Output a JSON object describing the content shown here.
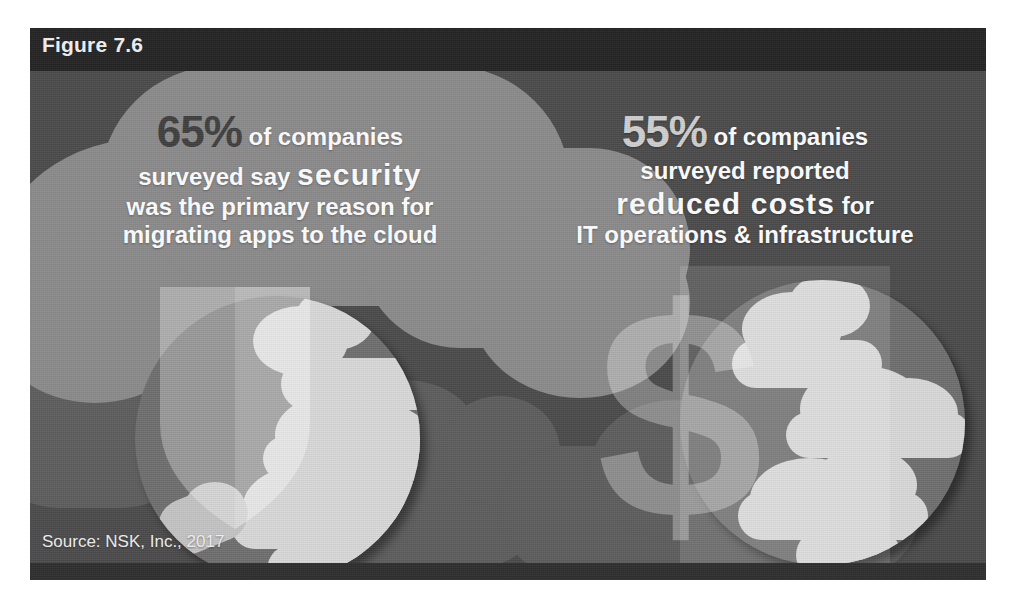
{
  "figure": {
    "label": "Figure 7.6"
  },
  "stats": [
    {
      "id": "security-stat",
      "percent": "65%",
      "line1_rest": " of companies",
      "line2_plain": "surveyed say ",
      "line2_emph": "security",
      "line3": "was the primary reason for",
      "line4": "migrating apps to the cloud",
      "icon": "shield-icon",
      "percent_color": "#3f3f3f"
    },
    {
      "id": "cost-stat",
      "percent": "55%",
      "line1_rest": " of companies",
      "line2_plain": "surveyed reported",
      "line3_emph": "reduced costs",
      "line3_rest": " for",
      "line4": "IT operations & infrastructure",
      "icon": "dollar-sign-icon",
      "percent_color": "#cfcfcf"
    }
  ],
  "source": {
    "text": "Source: NSK, Inc., 2017"
  },
  "colors": {
    "panel_background": "#4b4b4b",
    "header_band": "#232323",
    "bottom_band": "#2e2e2e",
    "light_blob": "#8b8b8b",
    "circle_sky": "#6f6f6f",
    "cloud": "#d9d9d9",
    "page_background": "#ffffff"
  }
}
